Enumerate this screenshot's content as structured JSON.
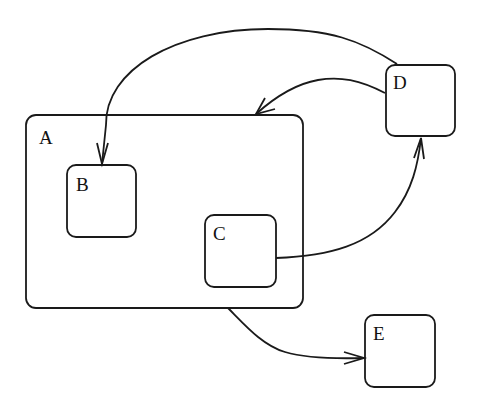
{
  "diagram": {
    "type": "statechart",
    "colors": {
      "stroke": "#1a1a1a",
      "background": "#ffffff",
      "text": "#111111"
    },
    "states": [
      {
        "id": "A",
        "label": "A",
        "x": 26,
        "y": 115,
        "width": 277,
        "height": 193,
        "radius": 10,
        "parent": null
      },
      {
        "id": "B",
        "label": "B",
        "x": 67,
        "y": 165,
        "width": 69,
        "height": 72,
        "radius": 9,
        "parent": "A"
      },
      {
        "id": "C",
        "label": "C",
        "x": 205,
        "y": 215,
        "width": 71,
        "height": 72,
        "radius": 9,
        "parent": "A"
      },
      {
        "id": "D",
        "label": "D",
        "x": 386,
        "y": 65,
        "width": 69,
        "height": 71,
        "radius": 9,
        "parent": null
      },
      {
        "id": "E",
        "label": "E",
        "x": 365,
        "y": 315,
        "width": 70,
        "height": 72,
        "radius": 9,
        "parent": null
      }
    ],
    "transitions": [
      {
        "from": "D",
        "to": "B"
      },
      {
        "from": "D",
        "to": "A"
      },
      {
        "from": "C",
        "to": "D"
      },
      {
        "from": "A",
        "to": "E"
      }
    ]
  }
}
